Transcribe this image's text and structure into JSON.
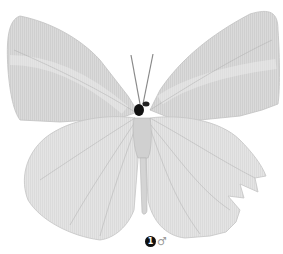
{
  "figure": {
    "palette": {
      "wing": "#d6d6d6",
      "wing_light": "#e6e6e6",
      "vein": "#9a9a9a",
      "body": "#c8c8c8",
      "head": "#111111"
    },
    "label": {
      "number": "1",
      "sex_symbol": "♂"
    }
  }
}
